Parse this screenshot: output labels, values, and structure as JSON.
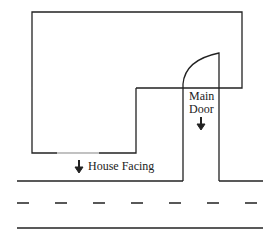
{
  "labels": {
    "main_door_line1": "Main",
    "main_door_line2": "Door",
    "house_facing": "House Facing"
  },
  "icons": {
    "door_arrow": "arrow-down",
    "facing_arrow": "arrow-down"
  },
  "colors": {
    "line": "#222222",
    "background": "#ffffff"
  }
}
